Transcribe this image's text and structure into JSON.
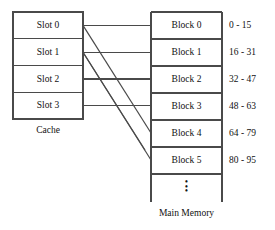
{
  "diagram": {
    "title_hidden": "",
    "stroke_color": "#4a4a4a",
    "text_color": "#111111",
    "background": "#ffffff"
  },
  "cache": {
    "caption": "Cache",
    "slots": [
      {
        "label": "Slot 0"
      },
      {
        "label": "Slot 1"
      },
      {
        "label": "Slot 2"
      },
      {
        "label": "Slot 3"
      }
    ]
  },
  "main_memory": {
    "caption": "Main Memory",
    "ellipsis": "•",
    "blocks": [
      {
        "label": "Block 0",
        "range": "0 - 15"
      },
      {
        "label": "Block 1",
        "range": "16 - 31"
      },
      {
        "label": "Block 2",
        "range": "32 - 47"
      },
      {
        "label": "Block 3",
        "range": "48 - 63"
      },
      {
        "label": "Block 4",
        "range": "64 - 79"
      },
      {
        "label": "Block 5",
        "range": "80 - 95"
      }
    ]
  },
  "mappings": {
    "direct": [
      {
        "from": "Slot 0",
        "to": "Block 0"
      },
      {
        "from": "Slot 1",
        "to": "Block 1"
      },
      {
        "from": "Slot 2",
        "to": "Block 2"
      },
      {
        "from": "Slot 3",
        "to": "Block 3"
      }
    ],
    "diagonal": [
      {
        "from": "Slot 0",
        "to": "Block 4"
      },
      {
        "from": "Slot 1",
        "to": "Block 5"
      }
    ]
  }
}
